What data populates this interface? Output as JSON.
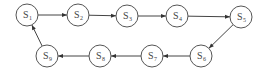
{
  "diagram": {
    "type": "state-cycle",
    "nodes": [
      {
        "id": "S1",
        "base": "S",
        "sub": "1"
      },
      {
        "id": "S2",
        "base": "S",
        "sub": "2"
      },
      {
        "id": "S3",
        "base": "S",
        "sub": "3"
      },
      {
        "id": "S4",
        "base": "S",
        "sub": "4"
      },
      {
        "id": "S5",
        "base": "S",
        "sub": "5"
      },
      {
        "id": "S6",
        "base": "S",
        "sub": "6"
      },
      {
        "id": "S7",
        "base": "S",
        "sub": "7"
      },
      {
        "id": "S8",
        "base": "S",
        "sub": "8"
      },
      {
        "id": "S9",
        "base": "S",
        "sub": "9"
      }
    ],
    "edges": [
      {
        "from": "S1",
        "to": "S2"
      },
      {
        "from": "S2",
        "to": "S3"
      },
      {
        "from": "S3",
        "to": "S4"
      },
      {
        "from": "S4",
        "to": "S5"
      },
      {
        "from": "S5",
        "to": "S6"
      },
      {
        "from": "S6",
        "to": "S7"
      },
      {
        "from": "S7",
        "to": "S8"
      },
      {
        "from": "S8",
        "to": "S9"
      },
      {
        "from": "S9",
        "to": "S1"
      }
    ],
    "colors": {
      "stroke": "#555555",
      "text": "#444444",
      "background": "#ffffff"
    }
  }
}
